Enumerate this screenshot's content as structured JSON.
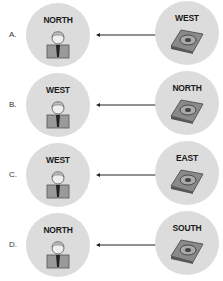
{
  "rows": [
    {
      "option": "A.",
      "left_label": "NORTH",
      "right_label": "WEST"
    },
    {
      "option": "B.",
      "left_label": "WEST",
      "right_label": "NORTH"
    },
    {
      "option": "C.",
      "left_label": "WEST",
      "right_label": "EAST"
    },
    {
      "option": "D.",
      "left_label": "NORTH",
      "right_label": "SOUTH"
    }
  ],
  "icons": {
    "left": "person-icon",
    "right": "hard-drive-icon",
    "connector": "arrow-left-icon"
  },
  "colors": {
    "circle": "#dcdcdc",
    "text": "#1a1a1a",
    "arrow": "#222222"
  }
}
